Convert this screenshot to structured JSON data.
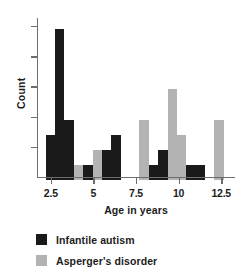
{
  "chart_data": {
    "type": "bar",
    "title": "",
    "xlabel": "Age in years",
    "ylabel": "Count",
    "xlim": [
      1.75,
      13.25
    ],
    "ylim": [
      0,
      10.6
    ],
    "grid": false,
    "legend_position": "bottom-left",
    "xticks": [
      "2.5",
      "5",
      "7.5",
      "10",
      "12.5"
    ],
    "xtick_values": [
      2.5,
      5,
      7.5,
      10,
      12.5
    ],
    "yticks": [
      "2",
      "4",
      "6",
      "8",
      "10"
    ],
    "ytick_values": [
      2,
      4,
      6,
      8,
      10
    ],
    "colors": {
      "infantile_autism": "#1a1a1a",
      "aspergers_disorder": "#b3b3b3",
      "axis": "#6d6d6d",
      "text": "#1c1c1c",
      "background": "#ffffff"
    },
    "series": [
      {
        "name": "Infantile autism",
        "color": "#1a1a1a",
        "x": [
          2.2,
          2.75,
          3.3,
          4.4,
          5.5,
          6.05,
          8.25,
          8.8,
          10.45,
          11.0
        ],
        "values": [
          3,
          10,
          4,
          1,
          2,
          3,
          1,
          2,
          1,
          1
        ]
      },
      {
        "name": "Asperger's disorder",
        "color": "#b3b3b3",
        "x": [
          3.85,
          4.95,
          7.7,
          9.35,
          9.9,
          12.1
        ],
        "values": [
          1,
          2,
          4,
          6,
          3,
          4
        ]
      }
    ],
    "bars": [
      {
        "series": "Infantile autism",
        "x": 2.2,
        "value": 3
      },
      {
        "series": "Infantile autism",
        "x": 2.75,
        "value": 10
      },
      {
        "series": "Infantile autism",
        "x": 3.3,
        "value": 4
      },
      {
        "series": "Asperger's disorder",
        "x": 3.85,
        "value": 1
      },
      {
        "series": "Infantile autism",
        "x": 4.4,
        "value": 1
      },
      {
        "series": "Asperger's disorder",
        "x": 4.95,
        "value": 2
      },
      {
        "series": "Infantile autism",
        "x": 5.5,
        "value": 2
      },
      {
        "series": "Infantile autism",
        "x": 6.05,
        "value": 3
      },
      {
        "series": "Asperger's disorder",
        "x": 7.7,
        "value": 4
      },
      {
        "series": "Infantile autism",
        "x": 8.25,
        "value": 1
      },
      {
        "series": "Infantile autism",
        "x": 8.8,
        "value": 2
      },
      {
        "series": "Asperger's disorder",
        "x": 9.35,
        "value": 6
      },
      {
        "series": "Asperger's disorder",
        "x": 9.9,
        "value": 3
      },
      {
        "series": "Infantile autism",
        "x": 10.45,
        "value": 1
      },
      {
        "series": "Infantile autism",
        "x": 11.0,
        "value": 1
      },
      {
        "series": "Asperger's disorder",
        "x": 12.1,
        "value": 4
      }
    ],
    "legend": [
      {
        "label": "Infantile autism",
        "color": "#1a1a1a"
      },
      {
        "label": "Asperger's disorder",
        "color": "#b3b3b3"
      }
    ]
  }
}
